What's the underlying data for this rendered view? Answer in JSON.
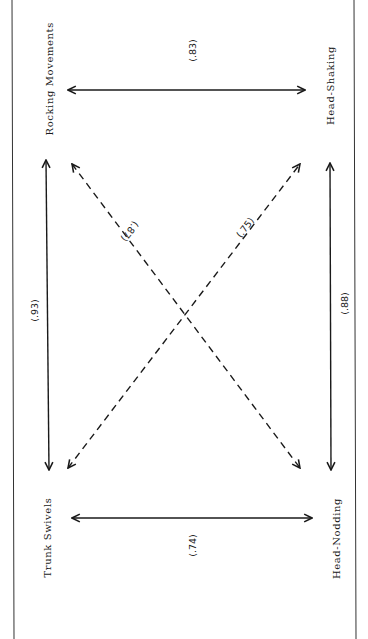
{
  "diagram": {
    "nodes": {
      "top_left": "Rocking Movements",
      "top_right": "Head-Shaking",
      "bottom_left": "Trunk Swivels",
      "bottom_right": "Head-Nodding"
    },
    "edges": [
      {
        "from": "Rocking Movements",
        "to": "Head-Shaking",
        "value": "(.83)",
        "style": "solid"
      },
      {
        "from": "Rocking Movements",
        "to": "Trunk Swivels",
        "value": "(.93)",
        "style": "solid"
      },
      {
        "from": "Head-Shaking",
        "to": "Head-Nodding",
        "value": "(.88)",
        "style": "solid"
      },
      {
        "from": "Trunk Swivels",
        "to": "Head-Nodding",
        "value": "(.74)",
        "style": "solid"
      },
      {
        "from": "Rocking Movements",
        "to": "Head-Nodding",
        "value": "(.87)",
        "style": "dashed"
      },
      {
        "from": "Head-Shaking",
        "to": "Trunk Swivels",
        "value": "(.75)",
        "style": "dashed"
      }
    ],
    "colors": {
      "ink": "#1a1a1a",
      "paper": "#ffffff"
    }
  }
}
